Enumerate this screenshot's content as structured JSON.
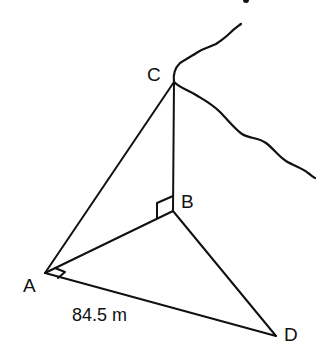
{
  "diagram": {
    "type": "3D geometry figure (cliff with vertical height and horizontal ground triangle)",
    "points": {
      "A": {
        "label": "A",
        "x": 45,
        "y": 273
      },
      "B": {
        "label": "B",
        "x": 173,
        "y": 211
      },
      "C": {
        "label": "C",
        "x": 174,
        "y": 82
      },
      "D": {
        "label": "D",
        "x": 276,
        "y": 336
      }
    },
    "segments": [
      {
        "from": "A",
        "to": "C"
      },
      {
        "from": "B",
        "to": "C"
      },
      {
        "from": "A",
        "to": "B"
      },
      {
        "from": "B",
        "to": "D"
      },
      {
        "from": "A",
        "to": "D"
      }
    ],
    "right_angles": [
      {
        "at": "B",
        "between": [
          "C",
          "A"
        ]
      },
      {
        "at": "A",
        "between": [
          "B",
          "D"
        ]
      }
    ],
    "measurements": [
      {
        "segment": "AD",
        "text": "84.5 m"
      }
    ],
    "decorations": [
      {
        "name": "cliff-edge-upper",
        "description": "wavy line from C up and to the right"
      },
      {
        "name": "cliff-edge-lower",
        "description": "wavy line from C down and to the right"
      }
    ]
  }
}
